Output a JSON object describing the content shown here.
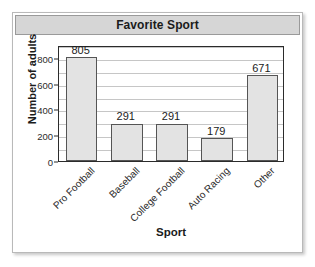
{
  "chart_data": {
    "type": "bar",
    "title": "Favorite Sport",
    "xlabel": "Sport",
    "ylabel": "Number of adults",
    "categories": [
      "Pro Football",
      "Baseball",
      "College Football",
      "Auto Racing",
      "Other"
    ],
    "values": [
      805,
      291,
      291,
      179,
      671
    ],
    "value_labels": [
      "805",
      "291",
      "291",
      "179",
      "671"
    ],
    "ylim": [
      0,
      900
    ],
    "ytick_labels": [
      "0",
      "200",
      "400",
      "600",
      "800"
    ],
    "ytick_values": [
      0,
      200,
      400,
      600,
      800
    ],
    "gridline_values": [
      100,
      200,
      300,
      400,
      500,
      600,
      700,
      800,
      900
    ],
    "grid": true,
    "legend": "none",
    "bar_fill_color": "#e3e3e3",
    "bar_edge_color": "#555555",
    "title_bar_color": "#d6d6d6",
    "axis_color": "#2b2b2b",
    "gridline_color": "#c6c6c6",
    "xtick_label_rotation": -45
  }
}
